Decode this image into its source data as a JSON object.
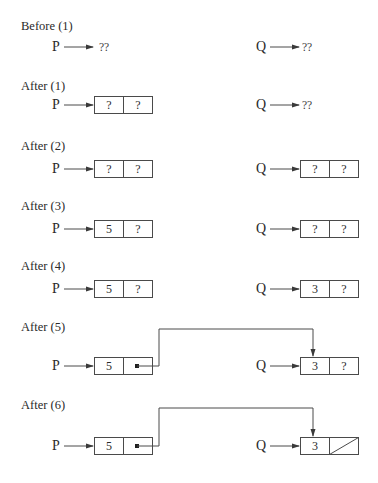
{
  "diagram": {
    "colors": {
      "line": "#4a4a4a",
      "text": "#2a2a2a",
      "background": "#ffffff"
    },
    "steps": [
      {
        "label": "Before (1)",
        "label_y": 19,
        "row_y": 47,
        "P": {
          "name": "P",
          "kind": "undefined",
          "value": "??"
        },
        "Q": {
          "name": "Q",
          "kind": "undefined",
          "value": "??"
        },
        "link": null
      },
      {
        "label": "After (1)",
        "label_y": 79,
        "row_y": 105,
        "P": {
          "name": "P",
          "kind": "node",
          "data": "?",
          "next": "?"
        },
        "Q": {
          "name": "Q",
          "kind": "undefined",
          "value": "??"
        },
        "link": null
      },
      {
        "label": "After (2)",
        "label_y": 139,
        "row_y": 169,
        "P": {
          "name": "P",
          "kind": "node",
          "data": "?",
          "next": "?"
        },
        "Q": {
          "name": "Q",
          "kind": "node",
          "data": "?",
          "next": "?"
        },
        "link": null
      },
      {
        "label": "After (3)",
        "label_y": 199,
        "row_y": 229,
        "P": {
          "name": "P",
          "kind": "node",
          "data": "5",
          "next": "?"
        },
        "Q": {
          "name": "Q",
          "kind": "node",
          "data": "?",
          "next": "?"
        },
        "link": null
      },
      {
        "label": "After (4)",
        "label_y": 259,
        "row_y": 289,
        "P": {
          "name": "P",
          "kind": "node",
          "data": "5",
          "next": "?"
        },
        "Q": {
          "name": "Q",
          "kind": "node",
          "data": "3",
          "next": "?"
        },
        "link": null
      },
      {
        "label": "After (5)",
        "label_y": 320,
        "row_y": 366,
        "P": {
          "name": "P",
          "kind": "node",
          "data": "5",
          "next": "pointer"
        },
        "Q": {
          "name": "Q",
          "kind": "node",
          "data": "3",
          "next": "?"
        },
        "link": {
          "from": "P.next",
          "to": "Q.node",
          "top_y": 329
        }
      },
      {
        "label": "After (6)",
        "label_y": 398,
        "row_y": 446,
        "P": {
          "name": "P",
          "kind": "node",
          "data": "5",
          "next": "pointer"
        },
        "Q": {
          "name": "Q",
          "kind": "node",
          "data": "3",
          "next": "nil"
        },
        "link": {
          "from": "P.next",
          "to": "Q.node",
          "top_y": 408
        }
      }
    ]
  }
}
